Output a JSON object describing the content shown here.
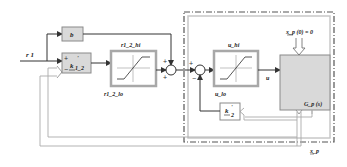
{
  "diagram": {
    "title": "",
    "colors": {
      "line": "#333333",
      "gray_line": "#aaaaaa",
      "block_fill": "#d9d9d9",
      "block_border": "#8a8a8a",
      "sat_border": "#a8a8a8",
      "dash_border": "#555555",
      "inner_border": "#c4c4c4"
    },
    "inputs": {
      "r1": "r 1"
    },
    "blocks": {
      "b": {
        "label": "b"
      },
      "k1_2": {
        "num": "k",
        "sub": "1_2",
        "sup": "'",
        "sign_plus": "+",
        "sign_minus": "−"
      },
      "sat_r1_2": {
        "hi_label": "r1_2_hi",
        "lo_label": "r1_2_lo"
      },
      "sat_u": {
        "hi_label": "u_hi",
        "lo_label": "u_lo"
      },
      "plant": {
        "label": "G_p (s)",
        "init_label": "x_p (0) = 0"
      },
      "k2": {
        "num": "k",
        "sub": "2",
        "sup": "'"
      }
    },
    "sums": {
      "sum1": {
        "signs": [
          "+",
          "+"
        ]
      },
      "sum2": {
        "signs": [
          "+",
          "−"
        ]
      }
    },
    "signals": {
      "u": "u",
      "x_p": "x_p"
    }
  }
}
